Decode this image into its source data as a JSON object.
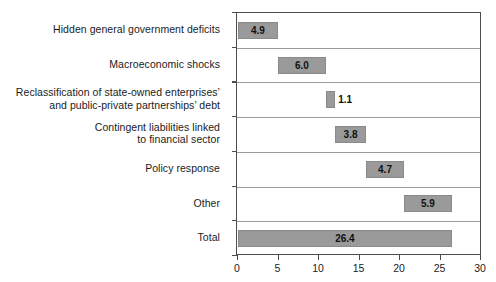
{
  "chart_data": {
    "type": "bar",
    "subtype": "waterfall-horizontal",
    "title": "",
    "subtitle": "",
    "xlabel": "",
    "ylabel": "",
    "xlim": [
      0,
      30
    ],
    "ylim": null,
    "grid": "horizontal-row-dividers",
    "legend": "none",
    "orientation": "horizontal",
    "bar_color": "#9a9a9a",
    "frame_color": "#4d4d4d",
    "divider_color": "#9a9a9a",
    "xticks": [
      0,
      5,
      10,
      15,
      20,
      25,
      30
    ],
    "xtick_labels": [
      "0",
      "5",
      "10",
      "15",
      "20",
      "25",
      "30"
    ],
    "categories": [
      "Hidden general government deficits",
      "Macroeconomic shocks",
      "Reclassification of state-owned enterprises’ and public-private partnerships’ debt",
      "Contingent liabilities linked to financial sector",
      "Policy response",
      "Other",
      "Total"
    ],
    "category_lines": [
      [
        "Hidden general government deficits"
      ],
      [
        "Macroeconomic shocks"
      ],
      [
        "Reclassification of state-owned enterprises’",
        "and public-private partnerships’ debt"
      ],
      [
        "Contingent liabilities linked",
        "to financial sector"
      ],
      [
        "Policy response"
      ],
      [
        "Other"
      ],
      [
        "Total"
      ]
    ],
    "values": [
      4.9,
      6.0,
      1.1,
      3.8,
      4.7,
      5.9,
      26.4
    ],
    "value_labels": [
      "4.9",
      "6.0",
      "1.1",
      "3.8",
      "4.7",
      "5.9",
      "26.4"
    ],
    "bar_starts": [
      0.0,
      4.9,
      10.9,
      12.0,
      15.8,
      20.5,
      0.0
    ],
    "bar_ends": [
      4.9,
      10.9,
      12.0,
      15.8,
      20.5,
      26.4,
      26.4
    ],
    "label_placement": [
      "inside",
      "inside",
      "outside",
      "inside",
      "inside",
      "inside",
      "inside"
    ]
  }
}
